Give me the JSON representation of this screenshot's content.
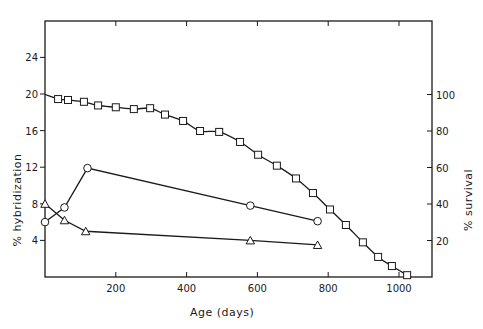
{
  "chart_data": {
    "type": "line",
    "title": "",
    "xlabel": "Age (days)",
    "ylabel": "% hybridization",
    "ylabel_right": "% survival",
    "xlim": [
      0,
      1050
    ],
    "ylim": [
      0,
      28
    ],
    "ylim_right": [
      0,
      153
    ],
    "x_ticks": [
      200,
      400,
      600,
      800,
      1000
    ],
    "x_tick_labels": [
      "200",
      "400",
      "600",
      "800",
      "1000"
    ],
    "y_ticks": [
      4,
      8,
      12,
      16,
      20,
      24
    ],
    "y_tick_labels": [
      "4",
      "8",
      "12",
      "16",
      "20",
      "24"
    ],
    "y_right_ticks": [
      20,
      40,
      60,
      80,
      100
    ],
    "y_right_tick_labels": [
      "20",
      "40",
      "60",
      "80",
      "100"
    ],
    "grid": false,
    "legend": null,
    "series": [
      {
        "name": "survival",
        "axis": "right",
        "marker": "square",
        "smooth": true,
        "x": [
          37,
          65,
          110,
          150,
          200,
          251,
          297,
          339,
          390,
          438,
          492,
          551,
          602,
          655,
          709,
          757,
          805,
          850,
          898,
          941,
          980,
          1023
        ],
        "values": [
          97.5,
          97,
          96,
          94,
          93,
          92,
          92.5,
          89,
          85.5,
          80,
          79.5,
          74,
          67,
          61,
          54,
          46,
          37,
          28.5,
          19,
          11,
          6,
          1
        ],
        "curve_start": [
          0,
          100
        ]
      },
      {
        "name": "hybridization (circles)",
        "axis": "left",
        "marker": "circle",
        "smooth": false,
        "x": [
          0,
          55,
          120,
          580,
          770
        ],
        "values": [
          6.0,
          7.6,
          11.9,
          7.8,
          6.1
        ]
      },
      {
        "name": "hybridization (triangles)",
        "axis": "left",
        "marker": "triangle",
        "smooth": false,
        "x": [
          0,
          55,
          115,
          580,
          770
        ],
        "values": [
          8.0,
          6.2,
          5.0,
          4.0,
          3.5
        ]
      }
    ]
  },
  "layout": {
    "plot": {
      "left": 45,
      "right": 432,
      "top": 21,
      "bottom": 277
    },
    "x_px_per_unit": 0.354,
    "y_px_per_unit": 9.15,
    "y_right_px_per_unit": 1.825,
    "ink_color": "#1a1a1a"
  }
}
